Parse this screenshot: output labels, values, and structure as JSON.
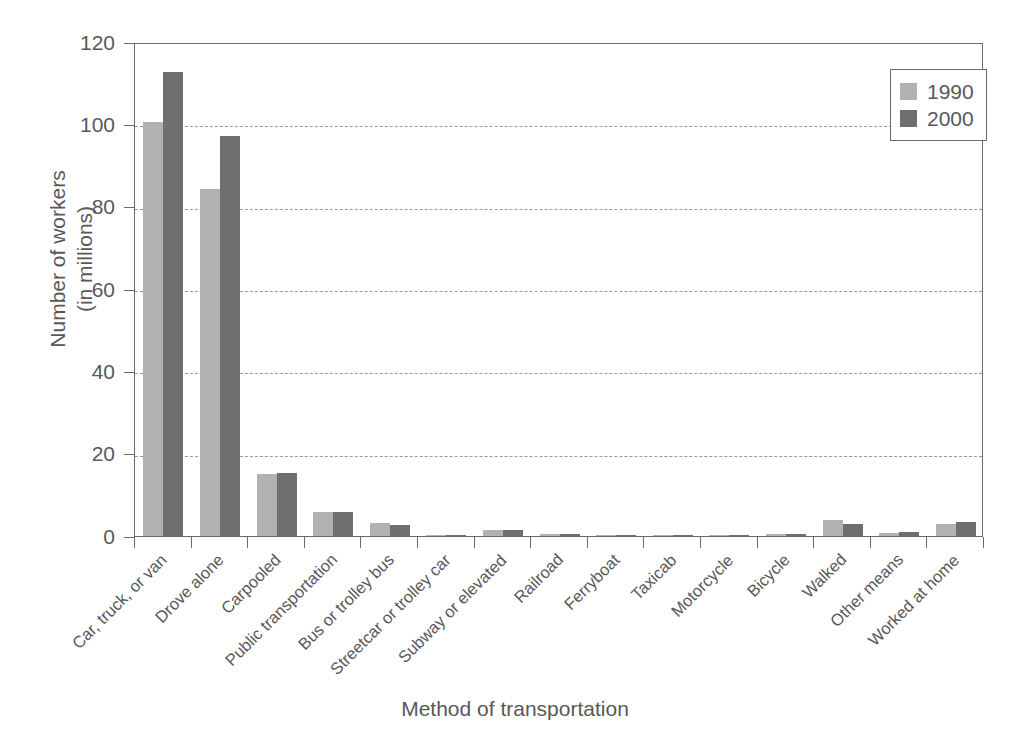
{
  "chart_data": {
    "type": "bar",
    "title": "",
    "xlabel": "Method of transportation",
    "ylabel": "Number of workers\n(in millions)",
    "ylabel_line1": "Number of workers",
    "ylabel_line2": "(in millions)",
    "ylim": [
      0,
      120
    ],
    "yticks": [
      0,
      20,
      40,
      60,
      80,
      100,
      120
    ],
    "ytick_labels": [
      "0",
      "20",
      "40",
      "60",
      "80",
      "100",
      "120"
    ],
    "grid": "horizontal-dashed",
    "legend_position": "top-right",
    "categories": [
      "Car, truck, or van",
      "Drove alone",
      "Carpooled",
      "Public transportation",
      "Bus or trolley bus",
      "Streetcar or trolley car",
      "Subway or elevated",
      "Railroad",
      "Ferryboat",
      "Taxicab",
      "Motorcycle",
      "Bicycle",
      "Walked",
      "Other means",
      "Worked at home"
    ],
    "series": [
      {
        "name": "1990",
        "color": "#b2b2b2",
        "values": [
          100.5,
          84.2,
          15.0,
          5.9,
          3.2,
          0.1,
          1.5,
          0.4,
          0.04,
          0.1,
          0.2,
          0.5,
          4.0,
          0.8,
          3.0
        ]
      },
      {
        "name": "2000",
        "color": "#6f6f6f",
        "values": [
          112.7,
          97.1,
          15.4,
          5.9,
          2.6,
          0.07,
          1.4,
          0.5,
          0.04,
          0.2,
          0.1,
          0.5,
          3.0,
          0.9,
          3.4
        ]
      }
    ]
  },
  "legend": {
    "entries": [
      {
        "label": "1990",
        "swatch": "light-gray-swatch"
      },
      {
        "label": "2000",
        "swatch": "dark-gray-swatch"
      }
    ]
  },
  "colors": {
    "series_1990": "#b2b2b2",
    "series_2000": "#6f6f6f",
    "axis": "#6a6a6c",
    "grid": "#9a9a9c",
    "text": "#58585a",
    "background": "#ffffff"
  }
}
